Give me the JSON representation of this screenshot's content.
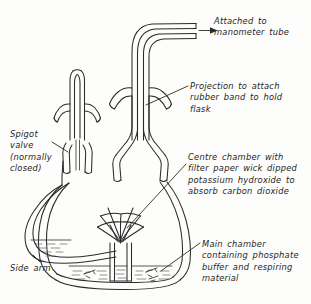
{
  "figure": {
    "background_color": "#fdfdfb",
    "ink_color": "#2b2b2b",
    "style": "hand-drawn line diagram"
  },
  "labels": {
    "manometer": "Attached to\nmanometer tube",
    "projection": "Projection to attach\nrubber band to hold\nflask",
    "centre_chamber": "Centre chamber with\nfilter paper wick dipped\npotassium hydroxide to\nabsorb carbon dioxide",
    "main_chamber": "Main chamber\ncontaining phosphate\nbuffer and respiring\nmaterial",
    "spigot_valve": "Spigot\nvalve\n(normally\nclosed)",
    "side_arm": "Side arm"
  },
  "parts": {
    "bent_tube": "bent-glass-tube",
    "manometer_arrow": "arrow-pointing-right",
    "side_arm_tube": "curved-side-arm-tube",
    "side_arm_liquid": "hatched-liquid-in-side-arm",
    "spigot_stopper": "spigot-valve-stopper",
    "left_neck": "left-ground-glass-neck",
    "right_neck": "right-ground-glass-neck",
    "projection_left": "left-glass-projection",
    "projection_right": "right-glass-projection",
    "flask_body": "conical-flask-body",
    "centre_chamber_tube": "inner-centre-chamber-tube",
    "filter_paper_wick": "fanned-filter-paper-wick",
    "buffer_liquid": "hatched-phosphate-buffer",
    "respiring_material": "respiring-insect-sketches"
  }
}
